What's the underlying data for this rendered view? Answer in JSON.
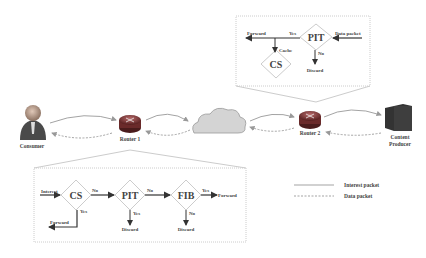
{
  "nodes": {
    "consumer": "Consumer",
    "router1": "Router 1",
    "router2": "Router 2",
    "producer_line1": "Content",
    "producer_line2": "Producer"
  },
  "top_box": {
    "pit": "PIT",
    "cs": "CS",
    "forward": "Forward",
    "yes": "Yes",
    "data_packet": "Data packet",
    "cache": "Cache",
    "no": "No",
    "discard": "Discard"
  },
  "bottom_box": {
    "interest": "Interest",
    "cs": "CS",
    "pit": "PIT",
    "fib": "FIB",
    "no1": "No",
    "no2": "No",
    "yes_fib": "Yes",
    "forward_right": "Forward",
    "yes_cs": "Yes",
    "forward_left": "Forward",
    "yes_pit": "Yes",
    "discard_pit": "Discard",
    "no_fib": "No",
    "discard_fib": "Discard"
  },
  "legend": {
    "interest_packet": "Interest packet",
    "data_packet": "Data packet"
  },
  "colors": {
    "line": "#999999",
    "router": "#8a3a3a",
    "cloud": "#d0d0d0",
    "server": "#3a3a3a"
  }
}
